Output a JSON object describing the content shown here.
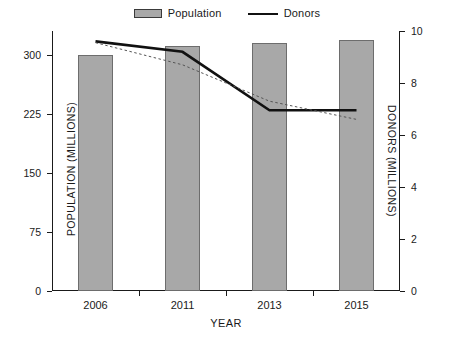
{
  "legend": {
    "position": "top-center",
    "items": [
      {
        "label": "Population",
        "marker": "bar-swatch-icon",
        "color": "#a8a8a8"
      },
      {
        "label": "Donors",
        "marker": "line-swatch-icon",
        "color": "#111111"
      }
    ]
  },
  "axes": {
    "x": {
      "title": "YEAR",
      "tick_labels": [
        "2006",
        "2011",
        "2013",
        "2015"
      ]
    },
    "y_left": {
      "title": "POPULATION (MILLIONS)",
      "tick_labels": [
        "0",
        "75",
        "150",
        "225",
        "300"
      ],
      "min": 0,
      "max": 330
    },
    "y_right": {
      "title": "DONORS (MILLIONS)",
      "tick_labels": [
        "0",
        "2",
        "4",
        "6",
        "8",
        "10"
      ],
      "min": 0,
      "max": 10
    }
  },
  "chart_data": {
    "type": "bar",
    "title": "",
    "xlabel": "YEAR",
    "ylabel": "POPULATION (MILLIONS)",
    "y2label": "DONORS (MILLIONS)",
    "categories": [
      "2006",
      "2011",
      "2013",
      "2015"
    ],
    "ylim": [
      0,
      330
    ],
    "y2lim": [
      0,
      10
    ],
    "yticks": [
      0,
      75,
      150,
      225,
      300
    ],
    "y2ticks": [
      0,
      2,
      4,
      6,
      8,
      10
    ],
    "grid": false,
    "legend": [
      "Population",
      "Donors"
    ],
    "series": [
      {
        "name": "Population",
        "type": "bar",
        "axis": "left",
        "units": "millions",
        "color": "#a8a8a8",
        "values": [
          299,
          311,
          315,
          319
        ]
      },
      {
        "name": "Donors",
        "type": "line",
        "axis": "right",
        "units": "millions",
        "color": "#111111",
        "values": [
          9.6,
          9.2,
          6.95,
          6.95
        ]
      },
      {
        "name": "Donors trendline",
        "type": "line",
        "style": "dotted",
        "axis": "right",
        "units": "millions",
        "color": "#555555",
        "values": [
          9.55,
          8.7,
          7.3,
          6.6
        ]
      }
    ]
  }
}
